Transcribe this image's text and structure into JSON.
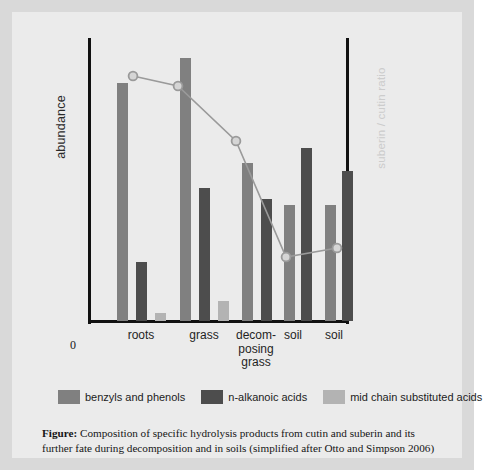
{
  "figure": {
    "caption_label": "Figure:",
    "caption_text": " Composition of specific hydrolysis products from cutin and suberin and its further fate during decomposition and in soils (simplified after Otto and Simpson 2006)"
  },
  "axes": {
    "y_left_label": "abundance",
    "y_right_label": "suberin / cutin ratio",
    "origin_label": "0"
  },
  "legend": {
    "items": [
      {
        "label": "benzyls and phenols",
        "color": "#808080"
      },
      {
        "label": "n-alkanoic acids",
        "color": "#4d4d4d"
      },
      {
        "label": "mid chain substituted acids",
        "color": "#b3b3b3"
      }
    ]
  },
  "chart_data": {
    "type": "bar",
    "title": "",
    "xlabel": "",
    "ylabel": "abundance",
    "y2label": "suberin / cutin ratio",
    "grid": false,
    "legend_position": "bottom",
    "categories": [
      "roots",
      "grass",
      "decom-\nposing\ngrass",
      "soil",
      "soil"
    ],
    "category_lines": [
      [
        "roots"
      ],
      [
        "grass"
      ],
      [
        "decom-",
        "posing",
        "grass"
      ],
      [
        "soil"
      ],
      [
        "soil"
      ]
    ],
    "ylim": [
      0,
      100
    ],
    "series": [
      {
        "name": "benzyls and phenols",
        "color": "#808080",
        "values": [
          84,
          93,
          0,
          41,
          41
        ]
      },
      {
        "name": "n-alkanoic acids",
        "color": "#4d4d4d",
        "values": [
          21,
          47,
          0,
          61,
          53
        ]
      },
      {
        "name": "mid chain substituted acids",
        "color": "#b3b3b3",
        "values": [
          3,
          7,
          0,
          0,
          0
        ]
      },
      {
        "name": "decomposing grass group",
        "color": "#808080",
        "values": [
          0,
          0,
          56,
          0,
          0
        ]
      },
      {
        "name": "decomposing grass dark",
        "color": "#4d4d4d",
        "values": [
          0,
          0,
          43,
          0,
          0
        ]
      }
    ],
    "bars": [
      {
        "group": 0,
        "series": "benzyls and phenols",
        "x": 29,
        "width": 11,
        "value": 84,
        "color": "#808080"
      },
      {
        "group": 0,
        "series": "n-alkanoic acids",
        "x": 48,
        "width": 11,
        "value": 21,
        "color": "#4d4d4d"
      },
      {
        "group": 0,
        "series": "mid chain substituted acids",
        "x": 67,
        "width": 11,
        "value": 3,
        "color": "#b3b3b3"
      },
      {
        "group": 1,
        "series": "benzyls and phenols",
        "x": 92,
        "width": 11,
        "value": 93,
        "color": "#808080"
      },
      {
        "group": 1,
        "series": "n-alkanoic acids",
        "x": 111,
        "width": 11,
        "value": 47,
        "color": "#4d4d4d"
      },
      {
        "group": 1,
        "series": "mid chain substituted acids",
        "x": 130,
        "width": 11,
        "value": 7,
        "color": "#b3b3b3"
      },
      {
        "group": 2,
        "series": "benzyls and phenols",
        "x": 154,
        "width": 11,
        "value": 56,
        "color": "#808080"
      },
      {
        "group": 2,
        "series": "n-alkanoic acids",
        "x": 173,
        "width": 11,
        "value": 43,
        "color": "#4d4d4d"
      },
      {
        "group": 3,
        "series": "benzyls and phenols",
        "x": 196,
        "width": 11,
        "value": 41,
        "color": "#808080"
      },
      {
        "group": 3,
        "series": "n-alkanoic acids",
        "x": 213,
        "width": 11,
        "value": 61,
        "color": "#4d4d4d"
      },
      {
        "group": 4,
        "series": "benzyls and phenols",
        "x": 237,
        "width": 11,
        "value": 41,
        "color": "#808080"
      },
      {
        "group": 4,
        "series": "n-alkanoic acids",
        "x": 254,
        "width": 11,
        "value": 53,
        "color": "#4d4d4d"
      }
    ],
    "line_series": {
      "name": "suberin / cutin ratio",
      "color": "#9a9a9a",
      "marker": "circle",
      "marker_fill": "#d5d5d5",
      "points": [
        {
          "x": 45,
          "y": 38,
          "value": 93
        },
        {
          "x": 90,
          "y": 48,
          "value": 88
        },
        {
          "x": 148,
          "y": 103,
          "value": 68
        },
        {
          "x": 198,
          "y": 219,
          "value": 25
        },
        {
          "x": 249,
          "y": 210,
          "value": 28
        }
      ]
    }
  },
  "category_positions": [
    {
      "label_lines": [
        "roots"
      ],
      "center": 53
    },
    {
      "label_lines": [
        "grass"
      ],
      "center": 116
    },
    {
      "label_lines": [
        "decom-",
        "posing",
        "grass"
      ],
      "center": 168
    },
    {
      "label_lines": [
        "soil"
      ],
      "center": 205
    },
    {
      "label_lines": [
        "soil"
      ],
      "center": 246
    }
  ]
}
